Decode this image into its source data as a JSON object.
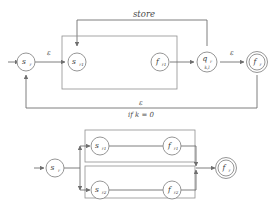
{
  "diagram": {
    "type": "finite-state-transducer",
    "title_visible": false,
    "colors": {
      "stroke": "#6f6f6f",
      "node_stroke": "#8a8a8a",
      "text": "#3a3a3a",
      "background": "#ffffff"
    },
    "top_machine": {
      "nodes": [
        {
          "id": "sr",
          "base": "s",
          "sub": "r",
          "sub2": "",
          "shape": "circle",
          "label": "s_r"
        },
        {
          "id": "sr1",
          "base": "s",
          "sub": "r1",
          "sub2": "",
          "shape": "circle",
          "label": "s_r1"
        },
        {
          "id": "fr1",
          "base": "f",
          "sub": "r1",
          "sub2": "",
          "shape": "circle",
          "label": "f_r1"
        },
        {
          "id": "qr",
          "base": "q",
          "sub": "r",
          "sub2": "k,l",
          "shape": "circle",
          "label": "q_r,kl"
        },
        {
          "id": "fr",
          "base": "f",
          "sub": "r",
          "sub2": "",
          "shape": "double-circle",
          "label": "f_r"
        }
      ],
      "edge_labels": {
        "store": "store",
        "eps_left": "ε",
        "eps_right": "ε",
        "eps_feedback": "ε",
        "condition": "if k = 0"
      }
    },
    "bottom_machine": {
      "nodes": [
        {
          "id": "b_sr",
          "base": "s",
          "sub": "r",
          "sub2": "",
          "shape": "circle",
          "label": "s_r"
        },
        {
          "id": "b_sr1",
          "base": "s",
          "sub": "r1",
          "sub2": "",
          "shape": "circle",
          "label": "s_r1"
        },
        {
          "id": "b_fr1",
          "base": "f",
          "sub": "r1",
          "sub2": "",
          "shape": "circle",
          "label": "f_r1"
        },
        {
          "id": "b_sr2",
          "base": "s",
          "sub": "r2",
          "sub2": "",
          "shape": "circle",
          "label": "s_r2"
        },
        {
          "id": "b_fr2",
          "base": "f",
          "sub": "r2",
          "sub2": "",
          "shape": "circle",
          "label": "f_r2"
        },
        {
          "id": "b_fr",
          "base": "f",
          "sub": "r",
          "sub2": "",
          "shape": "double-circle",
          "label": "f_r"
        }
      ],
      "edge_labels": {}
    }
  }
}
